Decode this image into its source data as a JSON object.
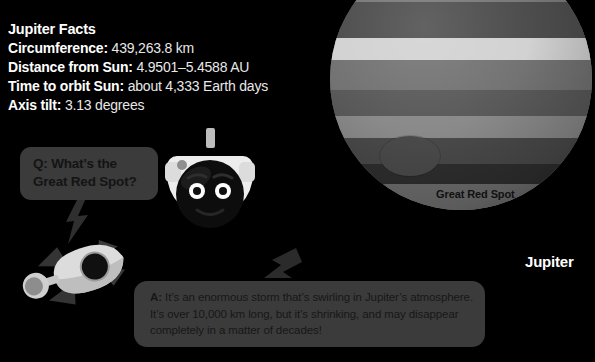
{
  "facts": {
    "title": "Jupiter Facts",
    "rows": [
      {
        "label": "Circumference:",
        "value": "439,263.8 km"
      },
      {
        "label": "Distance from Sun:",
        "value": "4.9501–5.4588 AU"
      },
      {
        "label": "Time to orbit Sun:",
        "value": "about 4,333 Earth days"
      },
      {
        "label": "Axis tilt:",
        "value": "3.13 degrees"
      }
    ]
  },
  "planet": {
    "name_label": "Jupiter",
    "spot_label": "Great Red Spot"
  },
  "question": {
    "line1": "Q: What’s the",
    "line2": "Great Red Spot?"
  },
  "answer": {
    "prefix": "A:",
    "text": " It’s an enormous storm that’s swirling in Jupiter’s atmosphere. It’s over 10,000 km long, but it’s shrinking, and may disappear completely in a matter of decades!"
  },
  "colors": {
    "background": "#000000",
    "bubble": "#3b3b3b",
    "bubble_text": "#141414",
    "text": "#ffffff",
    "planet_base": "#6a6a6a",
    "spot": "#4b4b4b",
    "bolt": "#2e2e2e",
    "astronaut_helmet": "#e8e8e8",
    "astronaut_visor": "#0c0c0c",
    "rocket_body": "#d8d8d8",
    "rocket_fin": "#3a3a3a"
  },
  "bands": [
    {
      "top": -10,
      "height": 40,
      "color": "#585858"
    },
    {
      "top": 30,
      "height": 24,
      "color": "#787878"
    },
    {
      "top": 54,
      "height": 36,
      "color": "#4d4d4d"
    },
    {
      "top": 90,
      "height": 22,
      "color": "#d2d2d2"
    },
    {
      "top": 112,
      "height": 30,
      "color": "#737373"
    },
    {
      "top": 142,
      "height": 26,
      "color": "#5a5a5a"
    },
    {
      "top": 168,
      "height": 22,
      "color": "#8a8a8a"
    },
    {
      "top": 190,
      "height": 26,
      "color": "#4a4a4a"
    },
    {
      "top": 216,
      "height": 20,
      "color": "#2f2f2f"
    },
    {
      "top": 236,
      "height": 26,
      "color": "#6f6f6f"
    },
    {
      "top": 262,
      "height": 22,
      "color": "#d4d4d4"
    },
    {
      "top": 284,
      "height": 26,
      "color": "#606060"
    },
    {
      "top": 310,
      "height": 40,
      "color": "#4a4a4a"
    }
  ],
  "icons": {
    "astronaut": "astronaut-icon",
    "rocket": "rocket-icon",
    "bolt_question": "lightning-bolt-icon",
    "bolt_answer": "lightning-bolt-icon"
  }
}
